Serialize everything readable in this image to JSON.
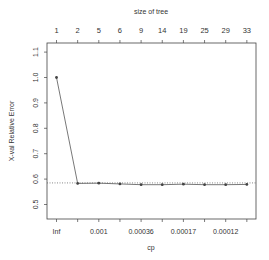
{
  "chart_data": {
    "type": "line",
    "title": "",
    "top_axis_label": "size of tree",
    "xlabel": "cp",
    "ylabel": "X-val Relative Error",
    "top_axis_ticks": [
      "1",
      "2",
      "5",
      "6",
      "9",
      "14",
      "19",
      "25",
      "29",
      "33"
    ],
    "bottom_axis_ticks_all": [
      "Inf",
      "",
      "0.001",
      "",
      "0.00036",
      "",
      "0.00017",
      "",
      "0.00012",
      ""
    ],
    "bottom_axis_labels_shown": [
      "Inf",
      "0.001",
      "0.00036",
      "0.00017",
      "0.00012"
    ],
    "y_ticks": [
      "0.5",
      "0.6",
      "0.7",
      "0.8",
      "0.9",
      "1.0",
      "1.1"
    ],
    "ylim": [
      0.47,
      1.13
    ],
    "grid": false,
    "reference_line": {
      "value": 0.585,
      "style": "dotted"
    },
    "series": [
      {
        "name": "X-val Relative Error",
        "size_of_tree": [
          1,
          2,
          5,
          6,
          9,
          14,
          19,
          25,
          29,
          33
        ],
        "values": [
          1.0,
          0.583,
          0.584,
          0.581,
          0.578,
          0.578,
          0.58,
          0.578,
          0.578,
          0.579
        ],
        "error": [
          0.003,
          0.003,
          0.003,
          0.003,
          0.003,
          0.003,
          0.003,
          0.003,
          0.003,
          0.003
        ]
      }
    ],
    "colors": {
      "line": "#555555",
      "axis": "#444444",
      "text": "#333333"
    }
  }
}
